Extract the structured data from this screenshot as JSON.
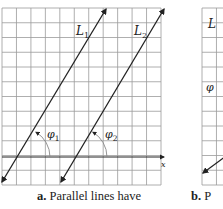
{
  "panels": [
    {
      "id": "a",
      "caption_letter": "a.",
      "caption_text": "Parallel lines have",
      "grid": {
        "x0": 2,
        "y0": 8,
        "x1": 161,
        "y1": 185,
        "cols": 11,
        "rows": 12
      },
      "x_axis": {
        "y": 157,
        "x_start": 2,
        "x_end": 164,
        "label": "x"
      },
      "lines": [
        {
          "label": "L",
          "subscript": "1",
          "from": [
            2,
            182
          ],
          "to": [
            106,
            9
          ],
          "label_pos": [
            76,
            35
          ]
        },
        {
          "label": "L",
          "subscript": "2",
          "from": [
            61,
            182
          ],
          "to": [
            164,
            9
          ],
          "label_pos": [
            134,
            35
          ]
        }
      ],
      "angles": [
        {
          "symbol": "φ",
          "subscript": "1",
          "vertex": [
            21,
            157
          ],
          "radius": 29,
          "label_pos": [
            47,
            138
          ]
        },
        {
          "symbol": "φ",
          "subscript": "2",
          "vertex": [
            78,
            157
          ],
          "radius": 29,
          "label_pos": [
            105,
            138
          ]
        }
      ]
    },
    {
      "id": "b",
      "caption_letter": "b.",
      "caption_text": "P",
      "grid": {
        "x0": 202,
        "y0": 8,
        "x1": 230,
        "y1": 185
      },
      "line_label": "L",
      "angle_label": "φ",
      "arrow_to": [
        203,
        173
      ]
    }
  ],
  "colors": {
    "grid": "#9a9a9a",
    "grid_minor": "#c4c4c4",
    "line": "#222222",
    "arc": "#888888"
  }
}
